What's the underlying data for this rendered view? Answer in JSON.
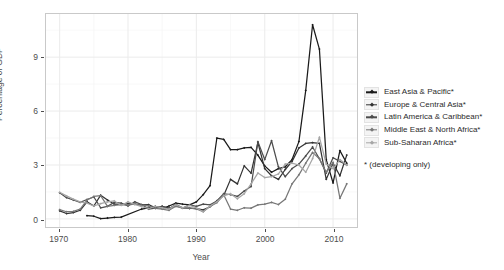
{
  "chart_data": {
    "type": "line",
    "title": "",
    "xlabel": "Year",
    "ylabel": "Percentage of GDP",
    "xlim": [
      1968.0,
      2013.5
    ],
    "ylim": [
      -0.45,
      11.4
    ],
    "xticks": [
      1970,
      1980,
      1990,
      2000,
      2010
    ],
    "yticks": [
      0,
      3,
      6,
      9
    ],
    "grid": true,
    "legend_position": "right",
    "legend_note": "* (developing only)",
    "series": [
      {
        "name": "East Asia & Pacific*",
        "color": "#1a1a1a",
        "x": [
          1974,
          1975,
          1976,
          1977,
          1978,
          1979,
          1982,
          1983,
          1984,
          1985,
          1986,
          1987,
          1988,
          1989,
          1990,
          1991,
          1992,
          1993,
          1994,
          1995,
          1996,
          1997,
          1998,
          1999,
          2000,
          2001,
          2002,
          2003,
          2004,
          2005,
          2006,
          2007,
          2008,
          2009,
          2010,
          2011,
          2012
        ],
        "y": [
          0.18,
          0.15,
          0.02,
          0.05,
          0.08,
          0.1,
          0.55,
          0.62,
          0.7,
          0.58,
          0.72,
          0.88,
          0.82,
          0.78,
          0.95,
          1.35,
          1.85,
          4.5,
          4.42,
          3.85,
          3.85,
          3.95,
          3.98,
          3.55,
          2.95,
          2.6,
          2.8,
          2.9,
          3.3,
          4.3,
          7.15,
          10.8,
          9.45,
          3.3,
          2.0,
          3.8,
          3.1
        ]
      },
      {
        "name": "Europe & Central Asia*",
        "color": "#333333",
        "x": [
          1970,
          1971,
          1972,
          1973,
          1974,
          1975,
          1976,
          1977,
          1978,
          1979,
          1980,
          1981,
          1982,
          1983,
          1984,
          1985,
          1986,
          1987,
          1988,
          1989,
          1990,
          1991,
          1992,
          1993,
          1994,
          1995,
          1996,
          1997,
          1998,
          1999,
          2000,
          2001,
          2002,
          2003,
          2004,
          2005,
          2006,
          2007,
          2008,
          2009,
          2010,
          2011,
          2012
        ],
        "y": [
          0.45,
          0.3,
          0.35,
          0.48,
          0.95,
          0.72,
          1.32,
          1.05,
          0.82,
          0.8,
          0.85,
          0.82,
          0.78,
          0.8,
          0.62,
          0.7,
          0.6,
          0.72,
          0.62,
          0.58,
          0.58,
          0.5,
          0.68,
          1.0,
          1.3,
          2.2,
          1.95,
          2.95,
          2.55,
          4.25,
          2.8,
          2.4,
          2.2,
          2.75,
          3.2,
          3.95,
          4.2,
          4.25,
          4.2,
          2.2,
          3.1,
          2.4,
          3.55
        ]
      },
      {
        "name": "Latin America & Caribbean*",
        "color": "#4d4d4d",
        "x": [
          1970,
          1971,
          1972,
          1973,
          1974,
          1975,
          1976,
          1977,
          1978,
          1979,
          1980,
          1981,
          1982,
          1983,
          1984,
          1985,
          1986,
          1987,
          1988,
          1989,
          1990,
          1991,
          1992,
          1993,
          1994,
          1995,
          1996,
          1997,
          1998,
          1999,
          2000,
          2001,
          2002,
          2003,
          2004,
          2005,
          2006,
          2007,
          2008,
          2009,
          2010,
          2011,
          2012
        ],
        "y": [
          1.45,
          1.18,
          1.05,
          0.92,
          1.08,
          1.22,
          0.62,
          0.7,
          0.92,
          0.88,
          0.72,
          0.95,
          0.8,
          0.55,
          0.6,
          0.7,
          0.55,
          0.82,
          0.6,
          0.78,
          0.7,
          0.82,
          0.78,
          1.0,
          1.4,
          1.35,
          1.25,
          1.55,
          1.8,
          4.3,
          3.3,
          4.35,
          2.9,
          2.35,
          2.8,
          3.05,
          3.5,
          4.0,
          3.35,
          2.55,
          3.4,
          3.2,
          3.0
        ]
      },
      {
        "name": "Middle East & North Africa*",
        "color": "#777777",
        "x": [
          1970,
          1971,
          1972,
          1973,
          1974,
          1975,
          1976,
          1977,
          1978,
          1979,
          1980,
          1981,
          1982,
          1983,
          1984,
          1985,
          1986,
          1987,
          1988,
          1989,
          1990,
          1991,
          1992,
          1993,
          1994,
          1995,
          1996,
          1997,
          1998,
          1999,
          2000,
          2001,
          2002,
          2003,
          2004,
          2005,
          2006,
          2007,
          2008,
          2009,
          2010,
          2011,
          2012
        ],
        "y": [
          0.52,
          0.4,
          0.42,
          0.55,
          1.05,
          1.25,
          1.3,
          0.7,
          0.75,
          0.8,
          0.78,
          0.82,
          0.75,
          0.72,
          0.58,
          0.55,
          0.48,
          0.7,
          0.6,
          0.62,
          0.55,
          0.4,
          0.7,
          0.9,
          1.35,
          0.55,
          0.48,
          0.62,
          0.6,
          0.78,
          0.82,
          0.92,
          0.8,
          1.1,
          1.95,
          2.45,
          3.1,
          3.7,
          3.35,
          2.6,
          3.15,
          1.15,
          1.95
        ]
      },
      {
        "name": "Sub-Saharan Africa*",
        "color": "#a6a6a6",
        "x": [
          1970,
          1971,
          1972,
          1973,
          1974,
          1975,
          1976,
          1977,
          1978,
          1979,
          1980,
          1981,
          1982,
          1983,
          1984,
          1985,
          1986,
          1987,
          1988,
          1989,
          1990,
          1991,
          1992,
          1993,
          1994,
          1995,
          1996,
          1997,
          1998,
          1999,
          2000,
          2001,
          2002,
          2003,
          2004,
          2005,
          2006,
          2007,
          2008,
          2009,
          2010,
          2011,
          2012
        ],
        "y": [
          1.48,
          1.28,
          1.1,
          0.95,
          0.88,
          0.72,
          0.85,
          0.95,
          1.0,
          0.75,
          0.95,
          0.8,
          0.68,
          0.58,
          0.7,
          0.62,
          0.55,
          0.78,
          0.62,
          0.75,
          0.62,
          0.4,
          0.72,
          0.95,
          1.28,
          1.4,
          1.12,
          1.4,
          1.95,
          2.55,
          2.3,
          2.35,
          2.5,
          3.05,
          3.1,
          3.0,
          2.6,
          3.35,
          4.55,
          3.05,
          2.8,
          3.3,
          3.0
        ]
      }
    ]
  },
  "axes": {
    "ylabel": "Percentage of GDP",
    "xlabel": "Year",
    "ytick_labels": [
      "0",
      "3",
      "6",
      "9"
    ],
    "xtick_labels": [
      "1970",
      "1980",
      "1990",
      "2000",
      "2010"
    ]
  },
  "legend": {
    "items": [
      {
        "label": "East Asia & Pacific*"
      },
      {
        "label": "Europe & Central Asia*"
      },
      {
        "label": "Latin America & Caribbean*"
      },
      {
        "label": "Middle East & North Africa*"
      },
      {
        "label": "Sub-Saharan Africa*"
      }
    ],
    "note": "* (developing only)"
  },
  "colors": {
    "panel_background": "#ffffff",
    "panel_border": "#c9c9c9",
    "grid_major": "#ebebeb",
    "grid_minor": "#f5f5f5",
    "text": "#4d4d4d"
  }
}
